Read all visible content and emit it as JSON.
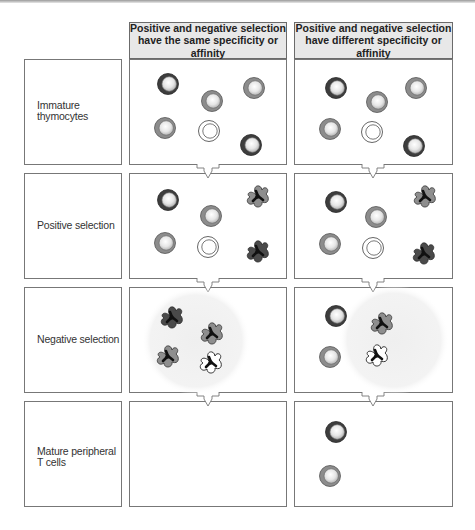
{
  "headers": {
    "same": {
      "line1": "Positive and negative selection",
      "line2": "have the same specificity or affinity"
    },
    "different": {
      "line1": "Positive and negative selection",
      "line2": "have different specificity or affinity"
    }
  },
  "rows": [
    {
      "label_line1": "Immature",
      "label_line2": "thymocytes"
    },
    {
      "label_line1": "Positive selection",
      "label_line2": ""
    },
    {
      "label_line1": "Negative selection",
      "label_line2": ""
    },
    {
      "label_line1": "Mature peripheral",
      "label_line2": "T cells"
    }
  ],
  "colors": {
    "border": "#777777",
    "header_bg": "#e8e8e8",
    "cell_dark": "#3d3d3d",
    "cell_mid": "#8c8c8c",
    "cell_white": "#ffffff",
    "glow": "#f1f1f1"
  }
}
